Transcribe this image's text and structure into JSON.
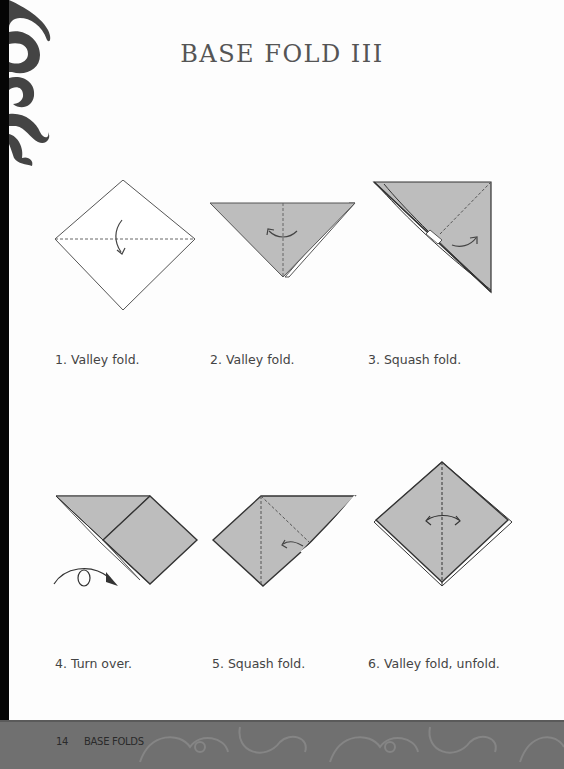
{
  "page": {
    "title": "BASE FOLD III",
    "accent_paper_color": "#bdbdbd",
    "line_color": "#333333"
  },
  "steps": [
    {
      "number": 1,
      "caption": "1. Valley fold.",
      "icon": "valley-fold-diagram"
    },
    {
      "number": 2,
      "caption": "2. Valley fold.",
      "icon": "valley-fold-triangle-diagram"
    },
    {
      "number": 3,
      "caption": "3. Squash fold.",
      "icon": "squash-fold-diagram"
    },
    {
      "number": 4,
      "caption": "4. Turn over.",
      "icon": "turn-over-diagram"
    },
    {
      "number": 5,
      "caption": "5. Squash fold.",
      "icon": "squash-fold-diagram"
    },
    {
      "number": 6,
      "caption": "6. Valley fold, unfold.",
      "icon": "valley-fold-unfold-diagram"
    }
  ],
  "footer": {
    "page_number": "14",
    "section": "BASE FOLDS"
  }
}
